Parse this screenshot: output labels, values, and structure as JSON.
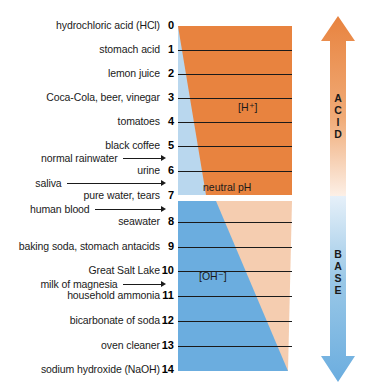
{
  "colors": {
    "acid": "#e8833f",
    "base": "#6baddf",
    "acid_pale": "#f8ded0",
    "base_pale": "#dceaf6",
    "text": "#1a1a1a",
    "background": "#ffffff"
  },
  "chart_data": {
    "type": "bar",
    "xlabel": "",
    "ylabel": "pH",
    "ylim": [
      0,
      14
    ],
    "grid": true,
    "legend_position": "right",
    "categories": [
      "hydrochloric acid (HCl)",
      "stomach acid",
      "lemon juice",
      "Coca-Cola, beer, vinegar",
      "tomatoes",
      "black coffee",
      "normal rainwater",
      "urine",
      "saliva",
      "pure water, tears",
      "human blood",
      "seawater",
      "baking soda, stomach antacids",
      "Great Salt Lake",
      "milk of magnesia",
      "household ammonia",
      "bicarbonate of soda",
      "oven cleaner",
      "sodium hydroxide (NaOH)"
    ],
    "values": [
      0,
      1,
      2,
      3,
      4,
      5,
      5.5,
      6,
      6.5,
      7,
      7.4,
      8,
      9,
      10,
      10.5,
      11,
      12,
      13,
      14
    ],
    "annotations": [
      "[H⁺]",
      "neutral pH",
      "[OH⁻]",
      "ACID",
      "BASE"
    ]
  },
  "scale": {
    "rows": [
      {
        "label": "hydrochloric acid (HCl)",
        "ph": "0",
        "tick": false,
        "arrow": false,
        "y": 26
      },
      {
        "label": "stomach acid",
        "ph": "1",
        "tick": true,
        "arrow": false,
        "y": 50
      },
      {
        "label": "lemon juice",
        "ph": "2",
        "tick": true,
        "arrow": false,
        "y": 74
      },
      {
        "label": "Coca-Cola, beer, vinegar",
        "ph": "3",
        "tick": true,
        "arrow": false,
        "y": 98
      },
      {
        "label": "tomatoes",
        "ph": "4",
        "tick": true,
        "arrow": false,
        "y": 122
      },
      {
        "label": "black coffee",
        "ph": "5",
        "tick": true,
        "arrow": false,
        "y": 146
      },
      {
        "label": "normal rainwater",
        "ph": "",
        "tick": false,
        "arrow": true,
        "y": 158
      },
      {
        "label": "urine",
        "ph": "6",
        "tick": true,
        "arrow": false,
        "y": 171
      },
      {
        "label": "saliva",
        "ph": "",
        "tick": false,
        "arrow": true,
        "y": 183
      },
      {
        "label": "pure water, tears",
        "ph": "7",
        "tick": false,
        "arrow": false,
        "y": 196
      },
      {
        "label": "human blood",
        "ph": "",
        "tick": false,
        "arrow": true,
        "y": 209
      },
      {
        "label": "seawater",
        "ph": "8",
        "tick": true,
        "arrow": false,
        "y": 222
      },
      {
        "label": "baking soda, stomach antacids",
        "ph": "9",
        "tick": true,
        "arrow": false,
        "y": 247
      },
      {
        "label": "Great Salt Lake",
        "ph": "10",
        "tick": true,
        "arrow": false,
        "y": 271
      },
      {
        "label": "milk of magnesia",
        "ph": "",
        "tick": false,
        "arrow": true,
        "y": 284
      },
      {
        "label": "household ammonia",
        "ph": "11",
        "tick": true,
        "arrow": false,
        "y": 296
      },
      {
        "label": "bicarbonate of soda",
        "ph": "12",
        "tick": true,
        "arrow": false,
        "y": 321
      },
      {
        "label": "oven cleaner",
        "ph": "13",
        "tick": true,
        "arrow": false,
        "y": 346
      },
      {
        "label": "sodium hydroxide (NaOH)",
        "ph": "14",
        "tick": false,
        "arrow": false,
        "y": 370
      }
    ]
  },
  "band_labels": {
    "hydrogen_ion": "[H⁺]",
    "neutral": "neutral pH",
    "hydroxide_ion": "[OH⁻]"
  },
  "side_arrows": {
    "acid": {
      "label": "ACID",
      "letters": [
        "A",
        "C",
        "I",
        "D"
      ],
      "direction": "up"
    },
    "base": {
      "label": "BASE",
      "letters": [
        "B",
        "A",
        "S",
        "E"
      ],
      "direction": "down"
    }
  }
}
